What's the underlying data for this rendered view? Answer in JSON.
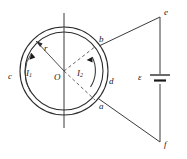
{
  "figure": {
    "type": "physics-circuit-diagram",
    "background_color": "#ffffff",
    "stroke_color": "#2b2b2b",
    "labels": {
      "center": "O",
      "radius": "r",
      "current_left": "I",
      "current_left_sub": "1",
      "current_right": "I",
      "current_right_sub": "2",
      "node_a": "a",
      "node_b": "b",
      "node_c": "c",
      "node_d": "d",
      "node_e": "e",
      "node_f": "f",
      "emf": "ε"
    },
    "geometry": {
      "circle_center_x": 64,
      "circle_center_y": 71,
      "outer_radius": 44,
      "inner_radius": 39,
      "node_b_x": 99,
      "node_b_y": 46,
      "node_a_x": 99,
      "node_a_y": 99,
      "node_e_x": 160,
      "node_e_y": 17,
      "node_f_x": 160,
      "node_f_y": 142,
      "battery_y": 79,
      "axis_top_y": 13,
      "axis_bottom_y": 128
    }
  }
}
